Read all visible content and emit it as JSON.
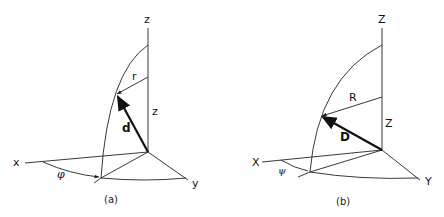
{
  "diagram_a": {
    "caption": "(a)",
    "axis_x": "x",
    "axis_y": "y",
    "axis_z": "z",
    "vector_label": "d",
    "radius_label": "r",
    "height_label": "z",
    "angle_label": "φ"
  },
  "diagram_b": {
    "caption": "(b)",
    "axis_x": "X",
    "axis_y": "Y",
    "axis_z": "Z",
    "vector_label": "D",
    "radius_label": "R",
    "height_label": "Z",
    "angle_label": "ψ"
  }
}
